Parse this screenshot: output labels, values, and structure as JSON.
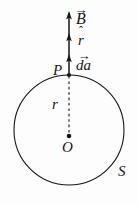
{
  "figure": {
    "kind": "physics-diagram",
    "background_color": "#fdfdfd",
    "ink_color": "#161616"
  },
  "labels": {
    "field_vector": {
      "symbol": "B",
      "accent": "→",
      "accent_name": "vector-arrow"
    },
    "unit_radial": {
      "symbol": "r",
      "accent": "ˆ",
      "accent_name": "hat"
    },
    "area_element": {
      "symbol": "da",
      "accent": "→",
      "accent_name": "vector-arrow"
    },
    "point_on_surface": {
      "symbol": "P"
    },
    "radius": {
      "symbol": "r"
    },
    "center": {
      "symbol": "O"
    },
    "surface": {
      "symbol": "S"
    }
  },
  "geometry": {
    "circle": {
      "cx": 69,
      "cy": 130,
      "r": 55,
      "stroke_width": 1.1,
      "label": "S"
    },
    "center_dot": {
      "cx": 69,
      "cy": 136,
      "r": 2.3
    },
    "point_P_dot": {
      "cx": 69,
      "cy": 75,
      "r": 2.1
    },
    "radius_line": {
      "x": 69,
      "y_top": 75,
      "y_bottom": 134,
      "style": "dashed"
    },
    "vector_shaft": {
      "x": 69,
      "y_top": 12,
      "y_bottom": 75,
      "style": "solid"
    },
    "arrowheads_y": [
      12,
      35,
      56
    ]
  }
}
